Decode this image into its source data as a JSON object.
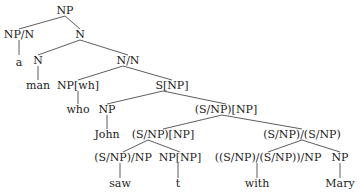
{
  "tree": {
    "nodes": [
      {
        "id": "n_root",
        "label": "NP",
        "x": 65,
        "y": 5
      },
      {
        "id": "n_np_n",
        "label": "NP/N",
        "x": 19,
        "y": 29
      },
      {
        "id": "n_a",
        "label": "a",
        "x": 19,
        "y": 57
      },
      {
        "id": "n_N1",
        "label": "N",
        "x": 80,
        "y": 29
      },
      {
        "id": "n_N2",
        "label": "N",
        "x": 38,
        "y": 55
      },
      {
        "id": "n_man",
        "label": "man",
        "x": 38,
        "y": 80
      },
      {
        "id": "n_NN",
        "label": "N/N",
        "x": 128,
        "y": 55
      },
      {
        "id": "n_npwh",
        "label": "NP[wh]",
        "x": 78,
        "y": 80
      },
      {
        "id": "n_snp",
        "label": "S[NP]",
        "x": 172,
        "y": 80
      },
      {
        "id": "n_who",
        "label": "who",
        "x": 78,
        "y": 104
      },
      {
        "id": "n_np_john",
        "label": "NP",
        "x": 107,
        "y": 104
      },
      {
        "id": "n_john",
        "label": "John",
        "x": 107,
        "y": 129
      },
      {
        "id": "n_snp_np",
        "label": "(S/NP)[NP]",
        "x": 226,
        "y": 104
      },
      {
        "id": "n_snp_np2",
        "label": "(S/NP)[NP]",
        "x": 163,
        "y": 129
      },
      {
        "id": "n_snpsnp",
        "label": "(S/NP)/(S/NP)",
        "x": 302,
        "y": 129
      },
      {
        "id": "n_saw_cat",
        "label": "(S/NP)/NP",
        "x": 123,
        "y": 152
      },
      {
        "id": "n_npnp",
        "label": "NP[NP]",
        "x": 180,
        "y": 152
      },
      {
        "id": "n_with_cat",
        "label": "((S/NP)/(S/NP))/NP",
        "x": 268,
        "y": 152
      },
      {
        "id": "n_np_mary",
        "label": "NP",
        "x": 340,
        "y": 152
      },
      {
        "id": "n_saw",
        "label": "saw",
        "x": 120,
        "y": 178
      },
      {
        "id": "n_t",
        "label": "t",
        "x": 178,
        "y": 178
      },
      {
        "id": "n_with",
        "label": "with",
        "x": 257,
        "y": 178
      },
      {
        "id": "n_mary",
        "label": "Mary",
        "x": 340,
        "y": 178
      }
    ],
    "edges": [
      {
        "x1": 65,
        "y1": 16,
        "x2": 19,
        "y2": 29
      },
      {
        "x1": 65,
        "y1": 16,
        "x2": 80,
        "y2": 29
      },
      {
        "x1": 19,
        "y1": 40,
        "x2": 19,
        "y2": 55
      },
      {
        "x1": 80,
        "y1": 40,
        "x2": 38,
        "y2": 55
      },
      {
        "x1": 80,
        "y1": 40,
        "x2": 128,
        "y2": 55
      },
      {
        "x1": 38,
        "y1": 66,
        "x2": 38,
        "y2": 80
      },
      {
        "x1": 123,
        "y1": 66,
        "x2": 78,
        "y2": 80
      },
      {
        "x1": 123,
        "y1": 66,
        "x2": 172,
        "y2": 80
      },
      {
        "x1": 78,
        "y1": 91,
        "x2": 78,
        "y2": 104
      },
      {
        "x1": 163,
        "y1": 91,
        "x2": 107,
        "y2": 104
      },
      {
        "x1": 163,
        "y1": 91,
        "x2": 226,
        "y2": 104
      },
      {
        "x1": 107,
        "y1": 115,
        "x2": 107,
        "y2": 129
      },
      {
        "x1": 222,
        "y1": 115,
        "x2": 163,
        "y2": 129
      },
      {
        "x1": 222,
        "y1": 115,
        "x2": 302,
        "y2": 129
      },
      {
        "x1": 148,
        "y1": 140,
        "x2": 123,
        "y2": 152
      },
      {
        "x1": 148,
        "y1": 140,
        "x2": 180,
        "y2": 152
      },
      {
        "x1": 302,
        "y1": 140,
        "x2": 268,
        "y2": 152
      },
      {
        "x1": 302,
        "y1": 140,
        "x2": 340,
        "y2": 152
      },
      {
        "x1": 120,
        "y1": 163,
        "x2": 120,
        "y2": 178
      },
      {
        "x1": 178,
        "y1": 163,
        "x2": 178,
        "y2": 178
      },
      {
        "x1": 257,
        "y1": 163,
        "x2": 257,
        "y2": 178
      },
      {
        "x1": 340,
        "y1": 163,
        "x2": 340,
        "y2": 178
      }
    ]
  }
}
